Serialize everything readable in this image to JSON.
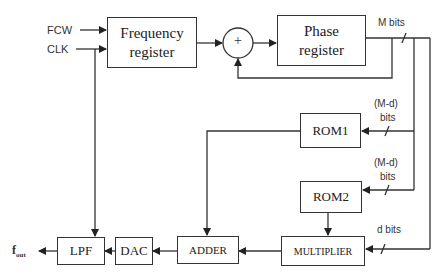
{
  "diagram": {
    "type": "block-diagram",
    "inputs": {
      "fcw": "FCW",
      "clk": "CLK"
    },
    "blocks": {
      "frequency_register": {
        "line1": "Frequency",
        "line2": "register"
      },
      "adder_circle": "+",
      "phase_register": {
        "line1": "Phase",
        "line2": "register"
      },
      "rom1": "ROM1",
      "rom2": "ROM2",
      "multiplier": "MULTIPLIER",
      "adder": "ADDER",
      "dac": "DAC",
      "lpf": "LPF"
    },
    "bus_labels": {
      "m_bits": "M bits",
      "rom1_bits_top": "(M-d)",
      "rom1_bits_bottom": "bits",
      "rom2_bits_top": "(M-d)",
      "rom2_bits_bottom": "bits",
      "d_bits": "d bits"
    },
    "output": {
      "f": "f",
      "sub": "out"
    },
    "colors": {
      "line": "#333333",
      "background": "#ffffff"
    }
  }
}
